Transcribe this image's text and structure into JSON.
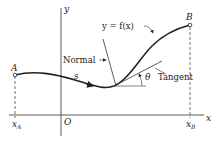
{
  "diagram": {
    "axes": {
      "x_label": "x",
      "y_label": "y",
      "origin_label": "O"
    },
    "points": {
      "A": {
        "label": "A",
        "x_label": "x",
        "x_sub": "A"
      },
      "B": {
        "label": "B",
        "x_label": "x",
        "x_sub": "B"
      }
    },
    "curve_label": "y = f(x)",
    "arc_length_label": "s",
    "normal_label": "Normal",
    "tangent_label": "Tangent",
    "angle_label": "θ",
    "colors": {
      "ink": "#222222",
      "background": "#ffffff"
    }
  }
}
